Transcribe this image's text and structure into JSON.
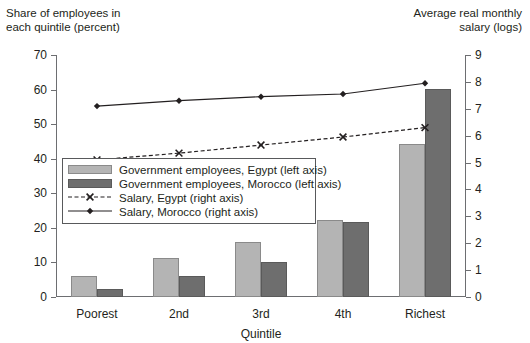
{
  "titles": {
    "left_axis_title": "Share of employees in\neach quintile (percent)",
    "right_axis_title": "Average real monthly\nsalary (logs)"
  },
  "legend": {
    "items": [
      {
        "label": "Government employees, Egypt (left axis)",
        "key": "swatch-egypt",
        "color": "#b4b4b4"
      },
      {
        "label": "Government employees, Morocco (left axis)",
        "key": "swatch-morocco",
        "color": "#6e6e6e"
      },
      {
        "label": "Salary, Egypt (right axis)",
        "key": "line-egypt",
        "color": "#231f20"
      },
      {
        "label": "Salary, Morocco (right axis)",
        "key": "line-morocco",
        "color": "#231f20"
      }
    ]
  },
  "chart_data": {
    "type": "bar",
    "title": "",
    "xlabel": "Quintile",
    "ylabel": "Share of employees in each quintile (percent)",
    "y2label": "Average real monthly salary (logs)",
    "categories": [
      "Poorest",
      "2nd",
      "3rd",
      "4th",
      "Richest"
    ],
    "ylim": [
      0,
      70
    ],
    "yticks": [
      0,
      10,
      20,
      30,
      40,
      50,
      60,
      70
    ],
    "y2lim": [
      0,
      9
    ],
    "y2ticks": [
      0,
      1,
      2,
      3,
      4,
      5,
      6,
      7,
      8,
      9
    ],
    "grid": false,
    "legend_position": "inside-upper-left",
    "series": [
      {
        "name": "Government employees, Egypt (left axis)",
        "type": "bar",
        "axis": "left",
        "color": "#b4b4b4",
        "values": [
          6,
          11.3,
          16,
          22.3,
          44.3
        ]
      },
      {
        "name": "Government employees, Morocco (left axis)",
        "type": "bar",
        "axis": "left",
        "color": "#6e6e6e",
        "values": [
          2.4,
          6,
          10,
          21.6,
          60.2
        ]
      },
      {
        "name": "Salary, Egypt (right axis)",
        "type": "line",
        "axis": "right",
        "color": "#231f20",
        "marker": "x",
        "dash": "dashed",
        "values": [
          5.1,
          5.35,
          5.65,
          5.95,
          6.3
        ]
      },
      {
        "name": "Salary, Morocco (right axis)",
        "type": "line",
        "axis": "right",
        "color": "#231f20",
        "marker": "diamond",
        "dash": "solid",
        "values": [
          7.1,
          7.3,
          7.45,
          7.55,
          7.95
        ]
      }
    ]
  }
}
